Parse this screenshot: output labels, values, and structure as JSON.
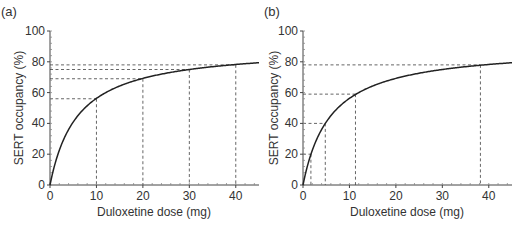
{
  "chart_data": [
    {
      "type": "line",
      "panel_label": "(a)",
      "title": "",
      "xlabel": "Duloxetine dose (mg)",
      "ylabel": "SERT occupancy (%)",
      "xlim": [
        0,
        45
      ],
      "ylim": [
        0,
        100
      ],
      "xticks": [
        0,
        10,
        20,
        30,
        40
      ],
      "yticks": [
        0,
        20,
        40,
        60,
        80,
        100
      ],
      "grid": false,
      "curve": {
        "model": "Emax",
        "emax": 90,
        "ed50": 6
      },
      "series": [
        {
          "name": "SERT occupancy",
          "x": [
            0,
            2,
            5,
            10,
            15,
            20,
            25,
            30,
            35,
            40,
            45
          ],
          "y": [
            0,
            22.5,
            40.9,
            56.3,
            64.3,
            69.2,
            72.6,
            75.0,
            76.8,
            78.3,
            79.4
          ]
        }
      ],
      "reference_lines": [
        {
          "x": 10,
          "y": 56
        },
        {
          "x": 20,
          "y": 69
        },
        {
          "x": 30,
          "y": 75
        },
        {
          "x": 40,
          "y": 78
        }
      ]
    },
    {
      "type": "line",
      "panel_label": "(b)",
      "title": "",
      "xlabel": "Duloxetine dose (mg)",
      "ylabel": "SERT occupancy (%)",
      "xlim": [
        0,
        45
      ],
      "ylim": [
        0,
        100
      ],
      "xticks": [
        0,
        10,
        20,
        30,
        40
      ],
      "yticks": [
        0,
        20,
        40,
        60,
        80,
        100
      ],
      "grid": false,
      "curve": {
        "model": "Emax",
        "emax": 90,
        "ed50": 6
      },
      "series": [
        {
          "name": "SERT occupancy",
          "x": [
            0,
            2,
            5,
            10,
            15,
            20,
            25,
            30,
            35,
            40,
            45
          ],
          "y": [
            0,
            22.5,
            40.9,
            56.3,
            64.3,
            69.2,
            72.6,
            75.0,
            76.8,
            78.3,
            79.4
          ]
        }
      ],
      "reference_lines": [
        {
          "x": 1.7,
          "y": 20
        },
        {
          "x": 4.8,
          "y": 40
        },
        {
          "x": 11.3,
          "y": 59
        },
        {
          "x": 38.2,
          "y": 78
        }
      ]
    }
  ]
}
